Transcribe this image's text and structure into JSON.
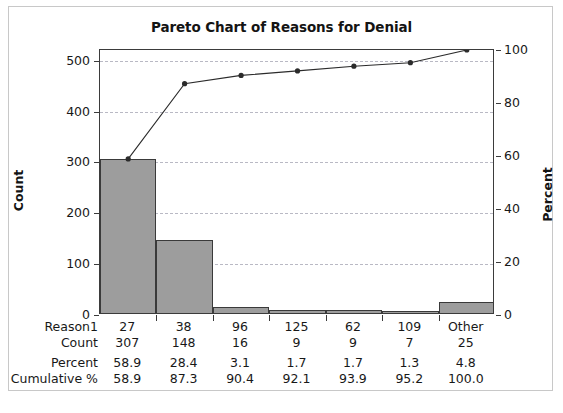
{
  "chart_data": {
    "type": "bar",
    "title": "Pareto Chart of Reasons for Denial",
    "xlabel": "",
    "ylabel": "Count",
    "y2label": "Percent",
    "categories": [
      "27",
      "38",
      "96",
      "125",
      "62",
      "109",
      "Other"
    ],
    "values": [
      307,
      148,
      16,
      9,
      9,
      7,
      25
    ],
    "series": [
      {
        "name": "Count",
        "values": [
          307,
          148,
          16,
          9,
          9,
          7,
          25
        ]
      },
      {
        "name": "Cumulative %",
        "values": [
          58.9,
          87.3,
          90.4,
          92.1,
          93.9,
          95.2,
          100.0
        ]
      }
    ],
    "percent": [
      58.9,
      28.4,
      3.1,
      1.7,
      1.7,
      1.3,
      4.8
    ],
    "cumulative_percent": [
      58.9,
      87.3,
      90.4,
      92.1,
      93.9,
      95.2,
      100.0
    ],
    "ylim": [
      0,
      521
    ],
    "y2lim": [
      0,
      100
    ],
    "yticks": [
      0,
      100,
      200,
      300,
      400,
      500
    ],
    "y2ticks": [
      0,
      20,
      40,
      60,
      80,
      100
    ],
    "grid": true,
    "legend": "none",
    "bar_color": "#9d9d9d",
    "bar_edge_color": "#3a3a3a",
    "line_color": "#2b2b2b",
    "grid_color": "#b9b9c4",
    "axis_color": "#3b3b3b"
  },
  "axes": {
    "y_left": {
      "title": "Count",
      "ticks": [
        "0",
        "100",
        "200",
        "300",
        "400",
        "500"
      ]
    },
    "y_right": {
      "title": "Percent",
      "ticks": [
        "0",
        "20",
        "40",
        "60",
        "80",
        "100"
      ]
    }
  },
  "table": {
    "rows": [
      {
        "label": "Reason1",
        "cells": [
          "27",
          "38",
          "96",
          "125",
          "62",
          "109",
          "Other"
        ]
      },
      {
        "label": "Count",
        "cells": [
          "307",
          "148",
          "16",
          "9",
          "9",
          "7",
          "25"
        ]
      },
      {
        "label": "Percent",
        "cells": [
          "58.9",
          "28.4",
          "3.1",
          "1.7",
          "1.7",
          "1.3",
          "4.8"
        ]
      },
      {
        "label": "Cumulative %",
        "cells": [
          "58.9",
          "87.3",
          "90.4",
          "92.1",
          "93.9",
          "95.2",
          "100.0"
        ]
      }
    ]
  }
}
